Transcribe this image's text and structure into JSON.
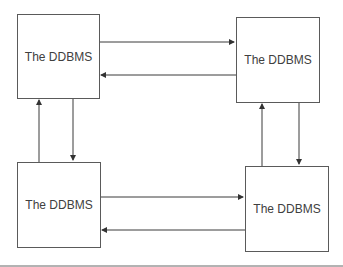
{
  "diagram": {
    "nodes": [
      {
        "id": "top-left",
        "label": "The DDBMS"
      },
      {
        "id": "top-right",
        "label": "The DDBMS"
      },
      {
        "id": "bottom-left",
        "label": "The DDBMS"
      },
      {
        "id": "bottom-right",
        "label": "The DDBMS"
      }
    ],
    "edges": [
      {
        "from": "top-left",
        "to": "top-right"
      },
      {
        "from": "top-right",
        "to": "top-left"
      },
      {
        "from": "bottom-left",
        "to": "bottom-right"
      },
      {
        "from": "bottom-right",
        "to": "bottom-left"
      },
      {
        "from": "bottom-left",
        "to": "top-left"
      },
      {
        "from": "top-left",
        "to": "bottom-left"
      },
      {
        "from": "bottom-right",
        "to": "top-right"
      },
      {
        "from": "top-right",
        "to": "bottom-right"
      }
    ],
    "colors": {
      "line": "#3a3a3a",
      "text": "#404040"
    }
  }
}
